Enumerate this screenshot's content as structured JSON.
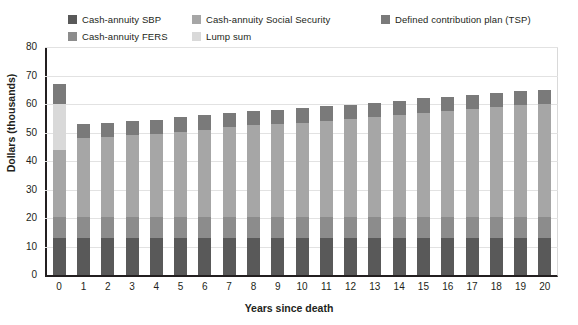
{
  "chart_data": {
    "type": "bar",
    "subtype": "stacked-vertical",
    "title": "",
    "xlabel": "Years since death",
    "ylabel": "Dollars (thousands)",
    "ylim": [
      0,
      80
    ],
    "ytick_step": 10,
    "ytick_labels": [
      "0",
      "10",
      "20",
      "30",
      "40",
      "50",
      "60",
      "70",
      "80"
    ],
    "grid": true,
    "grid_axis": "y",
    "legend_position": "top",
    "categories": [
      "0",
      "1",
      "2",
      "3",
      "4",
      "5",
      "6",
      "7",
      "8",
      "9",
      "10",
      "11",
      "12",
      "13",
      "14",
      "15",
      "16",
      "17",
      "18",
      "19",
      "20"
    ],
    "series": [
      {
        "name": "Cash-annuity SBP",
        "color": "#595959",
        "values": [
          13,
          13,
          13,
          13,
          13,
          13,
          13,
          13,
          13,
          13,
          13,
          13,
          13,
          13,
          13,
          13,
          13,
          13,
          13,
          13,
          13
        ]
      },
      {
        "name": "Cash-annuity FERS",
        "color": "#8c8c8c",
        "values": [
          7.5,
          7.5,
          7.5,
          7.5,
          7.5,
          7.5,
          7.5,
          7.5,
          7.5,
          7.5,
          7.5,
          7.5,
          7.5,
          7.5,
          7.5,
          7.5,
          7.5,
          7.5,
          7.5,
          7.5,
          7.5
        ]
      },
      {
        "name": "Cash-annuity Social Security",
        "color": "#a6a6a6",
        "values": [
          23.5,
          27.5,
          28,
          28.5,
          29,
          29.8,
          30.5,
          31.3,
          32,
          32.5,
          33,
          33.7,
          34.3,
          35,
          35.5,
          36.5,
          37,
          37.7,
          38.3,
          39,
          39.5
        ]
      },
      {
        "name": "Lump sum",
        "color": "#d9d9d9",
        "values": [
          16,
          0,
          0,
          0,
          0,
          0,
          0,
          0,
          0,
          0,
          0,
          0,
          0,
          0,
          0,
          0,
          0,
          0,
          0,
          0,
          0
        ]
      },
      {
        "name": "Defined contribution plan (TSP)",
        "color": "#7a7a7a",
        "values": [
          7,
          5,
          5,
          5,
          5,
          5,
          5,
          5,
          5,
          5,
          5,
          5,
          5,
          5,
          5,
          5,
          5,
          5,
          5,
          5,
          5
        ]
      }
    ],
    "totals": [
      67,
      53,
      53.5,
      54,
      54.5,
      55.3,
      56,
      56.8,
      57.5,
      58,
      58.5,
      59.2,
      59.8,
      60.5,
      61,
      62,
      62.5,
      63.2,
      63.8,
      64.5,
      65
    ]
  },
  "legend": {
    "columns": [
      {
        "items": [
          {
            "label": "Cash-annuity SBP",
            "color": "#595959",
            "swatch_name": "legend-swatch-sbp"
          },
          {
            "label": "Cash-annuity FERS",
            "color": "#8c8c8c",
            "swatch_name": "legend-swatch-fers"
          }
        ]
      },
      {
        "items": [
          {
            "label": "Cash-annuity Social Security",
            "color": "#a6a6a6",
            "swatch_name": "legend-swatch-social-security"
          },
          {
            "label": "Lump sum",
            "color": "#d9d9d9",
            "swatch_name": "legend-swatch-lump-sum"
          }
        ]
      },
      {
        "items": [
          {
            "label": "Defined contribution plan (TSP)",
            "color": "#7a7a7a",
            "swatch_name": "legend-swatch-tsp"
          }
        ]
      }
    ]
  },
  "axes": {
    "y_title": "Dollars (thousands)",
    "x_title": "Years since death"
  }
}
